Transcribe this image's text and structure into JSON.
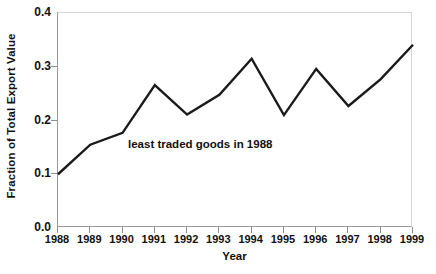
{
  "chart_data": {
    "type": "line",
    "title": "",
    "xlabel": "Year",
    "ylabel": "Fraction of Total Export Value",
    "categories": [
      "1988",
      "1989",
      "1990",
      "1991",
      "1992",
      "1993",
      "1994",
      "1995",
      "1996",
      "1997",
      "1998",
      "1999"
    ],
    "values": [
      0.1,
      0.155,
      0.177,
      0.266,
      0.211,
      0.248,
      0.315,
      0.21,
      0.296,
      0.227,
      0.277,
      0.341
    ],
    "series": [
      {
        "name": "least traded goods in 1988",
        "values": [
          0.1,
          0.155,
          0.177,
          0.266,
          0.211,
          0.248,
          0.315,
          0.21,
          0.296,
          0.227,
          0.277,
          0.341
        ]
      }
    ],
    "ylim": [
      0.0,
      0.4
    ],
    "ytick_labels": [
      "0.0",
      "0.1",
      "0.2",
      "0.3",
      "0.4"
    ],
    "ytick_values": [
      0.0,
      0.1,
      0.2,
      0.3,
      0.4
    ],
    "xtick_labels": [
      "1988",
      "1989",
      "1990",
      "1991",
      "1992",
      "1993",
      "1994",
      "1995",
      "1996",
      "1997",
      "1998",
      "1999"
    ],
    "grid": false,
    "legend": "none",
    "line_color": "#1a1a1a",
    "line_width": 2.4,
    "markers": "none",
    "annotations": [
      {
        "text": "least traded goods in 1988",
        "x": 1990.2,
        "y": 0.152
      }
    ]
  }
}
